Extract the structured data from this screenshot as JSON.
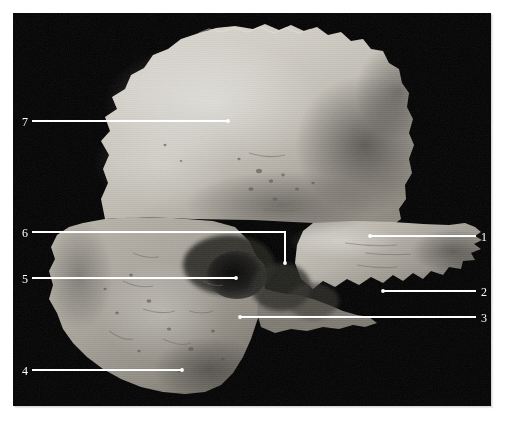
{
  "figure": {
    "kind": "anatomical-photograph",
    "background_color": "#ffffff",
    "plate_color": "#000000",
    "label_color": "#ffffff",
    "leader_color": "#ffffff"
  },
  "plate": {
    "x": 13,
    "y": 13,
    "width": 478,
    "height": 393
  },
  "callouts": [
    {
      "id": "callout-1",
      "label": "1",
      "side": "right",
      "label_x": 481,
      "label_y": 231,
      "line": [
        [
          476,
          236
        ],
        [
          370,
          236
        ]
      ],
      "dot": [
        370,
        236
      ]
    },
    {
      "id": "callout-2",
      "label": "2",
      "side": "right",
      "label_x": 481,
      "label_y": 286,
      "line": [
        [
          476,
          291
        ],
        [
          383,
          291
        ]
      ],
      "dot": [
        383,
        291
      ]
    },
    {
      "id": "callout-3",
      "label": "3",
      "side": "right",
      "label_x": 481,
      "label_y": 312,
      "line": [
        [
          476,
          317
        ],
        [
          240,
          317
        ]
      ],
      "dot": [
        240,
        317
      ]
    },
    {
      "id": "callout-4",
      "label": "4",
      "side": "left",
      "label_x": 22,
      "label_y": 365,
      "line": [
        [
          32,
          370
        ],
        [
          182,
          370
        ]
      ],
      "dot": [
        182,
        370
      ]
    },
    {
      "id": "callout-5",
      "label": "5",
      "side": "left",
      "label_x": 22,
      "label_y": 273,
      "line": [
        [
          32,
          278
        ],
        [
          236,
          278
        ]
      ],
      "dot": [
        236,
        278
      ]
    },
    {
      "id": "callout-6",
      "label": "6",
      "side": "left",
      "label_x": 22,
      "label_y": 227,
      "line": [
        [
          32,
          232
        ],
        [
          285,
          232
        ],
        [
          285,
          263
        ]
      ],
      "dot": [
        285,
        263
      ]
    },
    {
      "id": "callout-7",
      "label": "7",
      "side": "left",
      "label_x": 22,
      "label_y": 116,
      "line": [
        [
          32,
          121
        ],
        [
          228,
          121
        ]
      ],
      "dot": [
        228,
        121
      ]
    }
  ]
}
